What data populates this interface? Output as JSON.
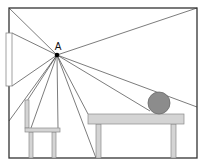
{
  "diagram": {
    "point_label": "A",
    "point": {
      "x": 57,
      "y": 55
    },
    "colors": {
      "frame": "#333333",
      "ray": "#444444",
      "furniture_fill": "#d4d4d4",
      "furniture_stroke": "#8a8a8a",
      "ball_fill": "#8c8c8c",
      "ball_stroke": "#6a6a6a",
      "window_fill": "#ffffff",
      "point": "#000000"
    },
    "room": {
      "x1": 9,
      "y1": 8,
      "x2": 197,
      "y2": 158
    },
    "window": {
      "x": 6,
      "y": 33,
      "w": 6,
      "h": 53
    },
    "rays": [
      {
        "x": 9,
        "y": 8
      },
      {
        "x": 12,
        "y": 33
      },
      {
        "x": 12,
        "y": 86
      },
      {
        "x": 9,
        "y": 121
      },
      {
        "x": 27,
        "y": 101
      },
      {
        "x": 31,
        "y": 128
      },
      {
        "x": 58,
        "y": 128
      },
      {
        "x": 96,
        "y": 158
      },
      {
        "x": 88,
        "y": 114
      },
      {
        "x": 150,
        "y": 111
      },
      {
        "x": 197,
        "y": 107
      },
      {
        "x": 197,
        "y": 8
      }
    ],
    "chair": {
      "back": {
        "x": 25,
        "y": 100,
        "w": 4,
        "h": 28
      },
      "seat": {
        "x": 25,
        "y": 128,
        "w": 35,
        "h": 4
      },
      "legs": [
        {
          "x": 29,
          "y": 132,
          "w": 4,
          "h": 26
        },
        {
          "x": 52,
          "y": 132,
          "w": 4,
          "h": 26
        }
      ]
    },
    "table": {
      "top": {
        "x": 88,
        "y": 114,
        "w": 96,
        "h": 10
      },
      "legs": [
        {
          "x": 96,
          "y": 124,
          "w": 5,
          "h": 34
        },
        {
          "x": 171,
          "y": 124,
          "w": 5,
          "h": 34
        }
      ]
    },
    "ball": {
      "cx": 159,
      "cy": 103,
      "r": 11
    }
  }
}
